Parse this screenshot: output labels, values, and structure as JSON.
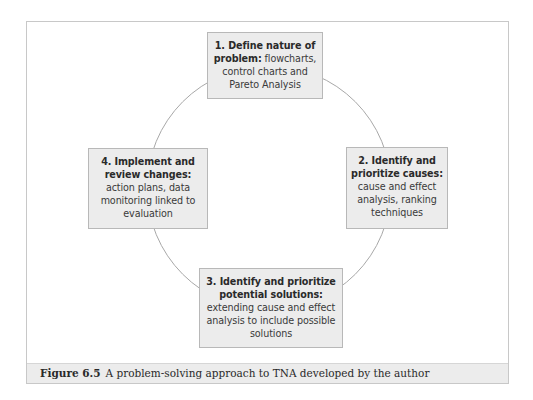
{
  "diagram": {
    "type": "cycle",
    "steps": [
      {
        "number": "1",
        "title": "1. Define nature of problem:",
        "title_line1": "1. Define nature of",
        "title_line2": "problem:",
        "description": "flowcharts, control charts and Pareto Analysis",
        "desc_line1": " flowcharts,",
        "desc_line2": "control charts and",
        "desc_line3": "Pareto Analysis"
      },
      {
        "number": "2",
        "title": "2. Identify and prioritize causes:",
        "title_line1": "2. Identify and",
        "title_line2": "prioritize causes:",
        "description": "cause and effect analysis, ranking techniques",
        "desc_line1": "cause and effect",
        "desc_line2": "analysis, ranking",
        "desc_line3": "techniques"
      },
      {
        "number": "3",
        "title": "3. Identify and prioritize potential solutions:",
        "title_line1": "3. Identify and prioritize",
        "title_line2": "potential solutions:",
        "description": "extending cause and effect analysis to include possible solutions",
        "desc_line1": "extending cause and effect",
        "desc_line2": "analysis to include possible",
        "desc_line3": "solutions"
      },
      {
        "number": "4",
        "title": "4. Implement and review changes:",
        "title_line1": "4. Implement and",
        "title_line2": "review changes:",
        "description": "action plans, data monitoring linked to evaluation",
        "desc_line1": "action plans, data",
        "desc_line2": "monitoring linked to",
        "desc_line3": "evaluation"
      }
    ],
    "colors": {
      "box_fill": "#ececec",
      "box_border": "#b8b8b8",
      "circle_stroke": "#a8a8a8",
      "frame_border": "#c8c8c8",
      "caption_fill": "#ececec"
    }
  },
  "caption": {
    "label": "Figure 6.5",
    "text": "A problem-solving approach to TNA developed by the author"
  }
}
